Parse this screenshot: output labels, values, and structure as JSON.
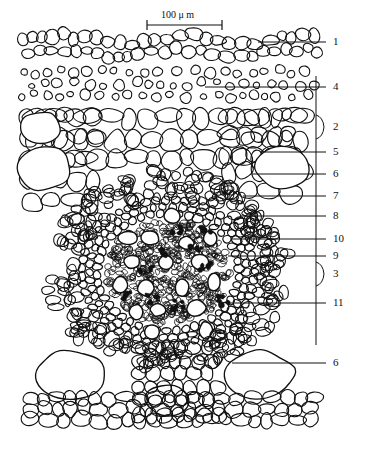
{
  "figure": {
    "kind": "botanical-cross-section-line-drawing",
    "scale_bar": {
      "value": "100",
      "unit": "μ m",
      "text": "100 μ m"
    }
  },
  "labels": [
    {
      "id": "1",
      "text": "1",
      "y": 42,
      "type": "leader"
    },
    {
      "id": "4",
      "text": "4",
      "y": 87,
      "type": "leader"
    },
    {
      "id": "2",
      "text": "2",
      "y": 127,
      "type": "brace"
    },
    {
      "id": "5",
      "text": "5",
      "y": 152,
      "type": "leader"
    },
    {
      "id": "6",
      "text": "6",
      "y": 174,
      "type": "leader"
    },
    {
      "id": "7",
      "text": "7",
      "y": 196,
      "type": "leader"
    },
    {
      "id": "8",
      "text": "8",
      "y": 216,
      "type": "leader"
    },
    {
      "id": "10",
      "text": "10",
      "y": 239,
      "type": "leader"
    },
    {
      "id": "9",
      "text": "9",
      "y": 256,
      "type": "leader"
    },
    {
      "id": "3",
      "text": "3",
      "y": 274,
      "type": "brace"
    },
    {
      "id": "11",
      "text": "11",
      "y": 303,
      "type": "leader"
    },
    {
      "id": "6b",
      "text": "6",
      "y": 363,
      "type": "leader"
    }
  ],
  "colors": {
    "ink": "#111111",
    "paper": "#ffffff"
  }
}
